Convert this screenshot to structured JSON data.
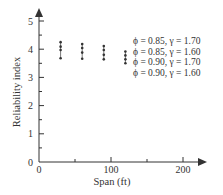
{
  "chart_data": {
    "type": "scatter",
    "title": "",
    "xlabel": "Span (ft)",
    "ylabel": "Reliability index",
    "xlim": [
      0,
      220
    ],
    "ylim": [
      0,
      5.2
    ],
    "x_ticks": [
      0,
      100,
      200
    ],
    "x_minor_ticks": [
      50,
      150
    ],
    "y_ticks": [
      0,
      1,
      2,
      3,
      4,
      5
    ],
    "y_minor_ticks": [
      0.5,
      1.5,
      2.5,
      3.5,
      4.5
    ],
    "grid": false,
    "legend_position": "top-right",
    "x": [
      30,
      60,
      90,
      120
    ],
    "series": [
      {
        "name": "ϕ = 0.85, γ = 1.70",
        "values": [
          4.25,
          4.18,
          4.11,
          3.92
        ]
      },
      {
        "name": "ϕ = 0.85, γ = 1.60",
        "values": [
          4.09,
          4.04,
          3.97,
          3.78
        ]
      },
      {
        "name": "ϕ = 0.90, γ = 1.70",
        "values": [
          3.97,
          3.88,
          3.8,
          3.64
        ]
      },
      {
        "name": "ϕ = 0.90, γ = 1.60",
        "values": [
          3.68,
          3.66,
          3.64,
          3.5
        ]
      }
    ]
  }
}
